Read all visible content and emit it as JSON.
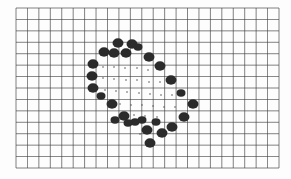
{
  "sheet": {
    "description": "Scanned graph paper with hand-drawn dark blobs forming a tilted diamond outline with small dots inside",
    "background": "#fdfdfd",
    "grid": {
      "x0": 16,
      "y0": 8,
      "x1": 279,
      "y1": 168,
      "cols": 23,
      "rows": 14,
      "line_color": "#3a3a3a"
    },
    "blob_color": "#2b2b2b",
    "dot_color": "#555555",
    "blobs": [
      [
        118,
        43,
        5
      ],
      [
        132,
        44,
        5
      ],
      [
        138,
        47,
        4
      ],
      [
        104,
        52,
        5
      ],
      [
        114,
        53,
        5
      ],
      [
        126,
        53,
        5
      ],
      [
        93,
        64,
        5
      ],
      [
        92,
        76,
        5
      ],
      [
        93,
        88,
        5
      ],
      [
        101,
        96,
        4
      ],
      [
        112,
        104,
        5
      ],
      [
        124,
        116,
        5
      ],
      [
        135,
        122,
        4
      ],
      [
        147,
        130,
        5
      ],
      [
        150,
        143,
        5
      ],
      [
        149,
        57,
        5
      ],
      [
        160,
        66,
        5
      ],
      [
        171,
        80,
        5
      ],
      [
        181,
        93,
        4
      ],
      [
        193,
        104,
        5
      ],
      [
        184,
        117,
        5
      ],
      [
        172,
        127,
        5
      ],
      [
        162,
        133,
        5
      ],
      [
        156,
        122,
        4
      ],
      [
        142,
        120,
        4
      ],
      [
        128,
        123,
        4
      ],
      [
        115,
        120,
        4
      ]
    ],
    "dots": [
      [
        103,
        67
      ],
      [
        114,
        67
      ],
      [
        125,
        68
      ],
      [
        137,
        68
      ],
      [
        148,
        70
      ],
      [
        103,
        78
      ],
      [
        114,
        79
      ],
      [
        126,
        80
      ],
      [
        137,
        80
      ],
      [
        149,
        82
      ],
      [
        160,
        82
      ],
      [
        105,
        90
      ],
      [
        116,
        91
      ],
      [
        127,
        92
      ],
      [
        139,
        93
      ],
      [
        150,
        94
      ],
      [
        161,
        95
      ],
      [
        172,
        95
      ],
      [
        120,
        104
      ],
      [
        131,
        105
      ],
      [
        142,
        105
      ],
      [
        153,
        106
      ],
      [
        164,
        107
      ],
      [
        175,
        107
      ],
      [
        134,
        115
      ],
      [
        145,
        116
      ],
      [
        157,
        117
      ],
      [
        140,
        134
      ]
    ]
  }
}
